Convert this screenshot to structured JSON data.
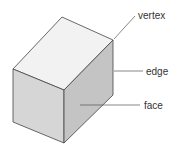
{
  "diagram": {
    "labels": {
      "vertex": "vertex",
      "edge": "edge",
      "face": "face"
    },
    "colors": {
      "top_face": "#f2f2f2",
      "left_face": "#d6d6d6",
      "right_face": "#c4c4c4",
      "outline": "#444444",
      "leader": "#555555"
    }
  }
}
